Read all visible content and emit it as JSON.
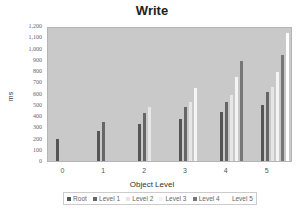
{
  "chart_data": {
    "type": "bar",
    "title": "Write",
    "xlabel": "Object Level",
    "ylabel": "ms",
    "ylim": [
      0,
      1200
    ],
    "yticks": [
      0,
      100,
      200,
      300,
      400,
      500,
      600,
      700,
      800,
      900,
      1000,
      1100,
      1200
    ],
    "ytick_labels": [
      "0",
      "100",
      "200",
      "300",
      "400",
      "500",
      "600",
      "700",
      "800",
      "900",
      "1,000",
      "1,100",
      "1,200"
    ],
    "categories": [
      "0",
      "1",
      "2",
      "3",
      "4",
      "5"
    ],
    "series": [
      {
        "name": "Root",
        "color": "#555555",
        "values": [
          200,
          270,
          330,
          380,
          445,
          505
        ]
      },
      {
        "name": "Level 1",
        "color": "#666666",
        "values": [
          null,
          350,
          430,
          490,
          530,
          620
        ]
      },
      {
        "name": "Level 2",
        "color": "#e6e6e6",
        "values": [
          null,
          null,
          490,
          530,
          600,
          665
        ]
      },
      {
        "name": "Level 3",
        "color": "#f4f4f4",
        "values": [
          null,
          null,
          null,
          660,
          760,
          800
        ]
      },
      {
        "name": "Level 4",
        "color": "#777777",
        "values": [
          null,
          null,
          null,
          null,
          900,
          960
        ]
      },
      {
        "name": "Level 5",
        "color": "#ffffff",
        "values": [
          null,
          null,
          null,
          null,
          null,
          1155
        ]
      }
    ],
    "grid": false,
    "legend_position": "bottom",
    "plot_background": "#c9c9c9"
  }
}
